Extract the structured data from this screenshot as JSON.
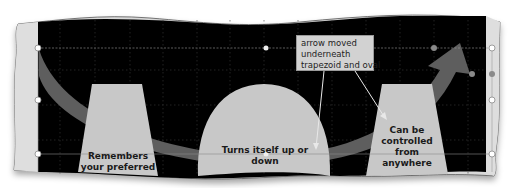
{
  "slide": {
    "background_color": "#000000",
    "frame_color": "#dcdcdc",
    "shape_fill": "#c8c8c8",
    "arrow_fill": "#5e5e5e"
  },
  "shapes": {
    "left_trapezoid": {
      "label_line1": "Remembers",
      "label_line2": "your preferred"
    },
    "oval": {
      "label_line1": "Turns itself up or",
      "label_line2": "down"
    },
    "right_trapezoid": {
      "label_line1": "Can be",
      "label_line2": "controlled",
      "label_line3": "from",
      "label_line4": "anywhere"
    }
  },
  "callout": {
    "line1": "arrow moved",
    "line2": "underneath",
    "line3": "trapezoid and oval"
  }
}
